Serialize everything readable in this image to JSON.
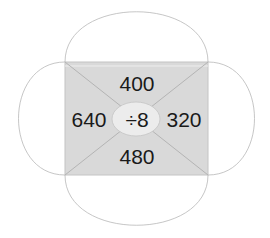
{
  "diagram": {
    "type": "division-wheel",
    "center_label": "÷8",
    "values": {
      "top": "400",
      "left": "640",
      "right": "320",
      "bottom": "480"
    },
    "colors": {
      "rect_fill": "#d9d9d9",
      "ellipse_fill": "#ececec",
      "stroke": "#b0b0b0",
      "text": "#1a1a1a"
    }
  }
}
